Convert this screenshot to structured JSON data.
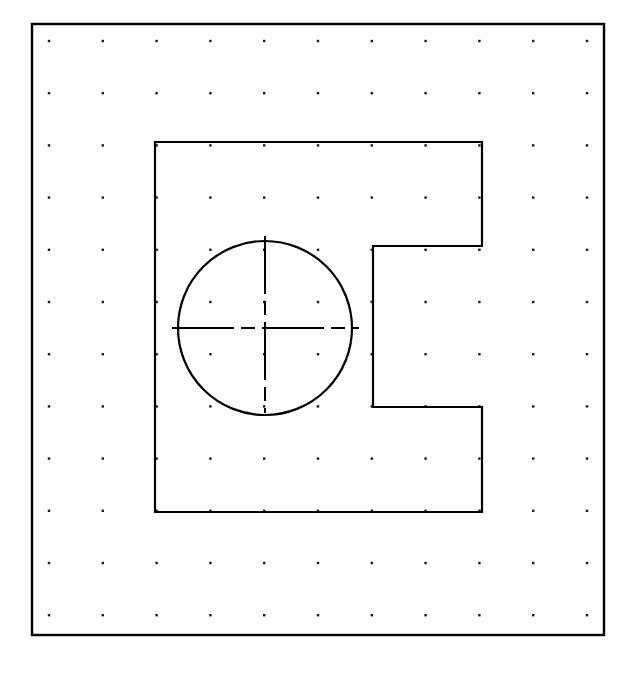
{
  "app": {
    "title": "CAD Sketch View",
    "canvas_width": 637,
    "canvas_height": 675,
    "background_color": "#fdfdfd",
    "line_color": "#000000",
    "grid_dot_color": "#1a1a1a"
  },
  "border_frame": {
    "name": "drawing-border",
    "x": 32,
    "y": 24,
    "width": 572,
    "height": 611,
    "stroke_width": 2.4,
    "color": "#000000"
  },
  "grid": {
    "label": "snap-dot-grid",
    "origin_x": 49,
    "origin_y": 41,
    "spacing_x": 53.8,
    "spacing_y": 52.2,
    "columns": 11,
    "rows": 12,
    "dot_size": 2.4,
    "color": "#1a1a1a"
  },
  "shapes": {
    "c_block": {
      "label": "c-shaped-block-outline",
      "stroke_width": 2.2,
      "color": "#000000",
      "points": [
        [
          155,
          142
        ],
        [
          482,
          142
        ],
        [
          482,
          246
        ],
        [
          373,
          246
        ],
        [
          373,
          407
        ],
        [
          482,
          407
        ],
        [
          482,
          512
        ],
        [
          155,
          512
        ]
      ],
      "closed": true,
      "outer_left": 155,
      "outer_right": 482,
      "outer_top": 142,
      "outer_bottom": 512,
      "notch_left": 373,
      "notch_top": 246,
      "notch_bottom": 407
    },
    "circle": {
      "label": "bore-circle",
      "center_x": 265,
      "center_y": 328,
      "radius": 87,
      "stroke_width": 2.2,
      "color": "#000000"
    },
    "centerline_horizontal": {
      "label": "horizontal-centerline",
      "x1": 172,
      "y1": 328,
      "x2": 359,
      "y2": 328,
      "stroke_width": 2.0,
      "dash": "62 7 14 7",
      "color": "#000000"
    },
    "centerline_vertical": {
      "label": "vertical-centerline",
      "x1": 265,
      "y1": 236,
      "x2": 265,
      "y2": 413,
      "stroke_width": 2.0,
      "dash": "58 7 14 7",
      "color": "#000000"
    }
  },
  "annotations": {
    "figure_caption": "",
    "dimension_labels": []
  }
}
